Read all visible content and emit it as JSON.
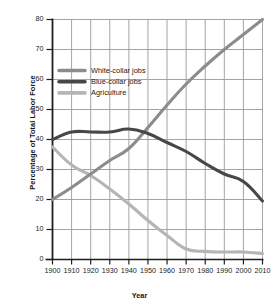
{
  "chart_data": {
    "type": "line",
    "title": "",
    "xlabel": "Year",
    "ylabel": "Percentage of Total Labor Force",
    "xlim": [
      1900,
      2010
    ],
    "ylim": [
      0,
      80
    ],
    "grid": true,
    "legend_position": "upper-left-inside",
    "x": [
      1900,
      1910,
      1920,
      1930,
      1940,
      1950,
      1960,
      1970,
      1980,
      1990,
      2000,
      2010
    ],
    "xticks": [
      "1900",
      "1910",
      "1920",
      "1930",
      "1940",
      "1950",
      "1960",
      "1970",
      "1980",
      "1990",
      "2000",
      "2010"
    ],
    "yticks": [
      "0",
      "10",
      "20",
      "30",
      "40",
      "50",
      "60",
      "70",
      "80"
    ],
    "series": [
      {
        "name": "White-collar jobs",
        "color": "#8c8c8c",
        "values": [
          20.0,
          24.0,
          28.5,
          33.0,
          37.0,
          44.0,
          51.5,
          58.5,
          64.5,
          70.0,
          75.0,
          80.0
        ]
      },
      {
        "name": "Blue-collar jobs",
        "color": "#474747",
        "values": [
          40.0,
          42.5,
          42.5,
          42.5,
          43.5,
          42.0,
          39.0,
          36.0,
          32.0,
          28.5,
          26.0,
          19.5
        ]
      },
      {
        "name": "Agriculture",
        "color": "#b5b5b5",
        "values": [
          37.5,
          31.5,
          28.0,
          23.5,
          18.5,
          13.0,
          8.0,
          3.5,
          2.7,
          2.5,
          2.5,
          2.0
        ]
      }
    ]
  },
  "axes": {
    "y_title": "Percentage of Total Labor Force",
    "x_title": "Year"
  },
  "legend": {
    "items": [
      {
        "label": "White-collar jobs",
        "color": "#8c8c8c"
      },
      {
        "label": "Blue-collar jobs",
        "color": "#474747"
      },
      {
        "label": "Agriculture",
        "color": "#b5b5b5"
      }
    ]
  },
  "style": {
    "grid_color": "#9a9a9a",
    "axis_color": "#1e1e1e",
    "background": "#ffffff"
  }
}
